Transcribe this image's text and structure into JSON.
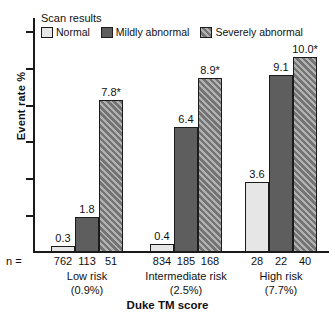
{
  "chart_data": {
    "type": "bar",
    "title": "",
    "xlabel": "Duke TM score",
    "ylabel": "Event rate %",
    "ylim": [
      0,
      12
    ],
    "grid": false,
    "legend_position": "top-left",
    "legend_title": "Scan results",
    "categories": [
      "Low risk",
      "Intermediate risk",
      "High risk"
    ],
    "category_sublabels": [
      "(0.9%)",
      "(2.5%)",
      "(7.7%)"
    ],
    "n_prefix": "n =",
    "series": [
      {
        "name": "Normal",
        "fill": "light-gray",
        "color": "#e6e6e6",
        "values": [
          0.3,
          0.4,
          3.6
        ],
        "labels": [
          "0.3",
          "0.4",
          "3.6"
        ],
        "n": [
          762,
          834,
          28
        ]
      },
      {
        "name": "Mildly abnormal",
        "fill": "dark-gray",
        "color": "#5e5e5e",
        "values": [
          1.8,
          6.4,
          9.1
        ],
        "labels": [
          "1.8",
          "6.4",
          "9.1"
        ],
        "n": [
          113,
          185,
          22
        ]
      },
      {
        "name": "Severely abnormal",
        "fill": "diagonal-hatch",
        "color": "#8a8a8a",
        "values": [
          7.8,
          8.9,
          10.0
        ],
        "labels": [
          "7.8*",
          "8.9*",
          "10.0*"
        ],
        "n": [
          51,
          168,
          40
        ]
      }
    ],
    "y_tick_count": 6,
    "y_tick_labels": [
      "",
      "",
      "",
      "",
      "",
      ""
    ],
    "annotation_marker": "*"
  }
}
